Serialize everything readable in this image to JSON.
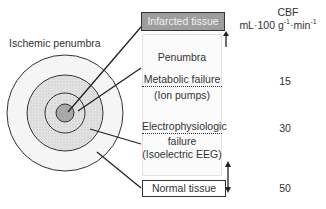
{
  "title": "Ischemic penumbra",
  "regions": {
    "infarcted": "Infarcted tissue",
    "penumbra": "Penumbra",
    "metabolic_failure": "Metabolic failure",
    "metabolic_detail": "(Ion pumps)",
    "electro_failure_line1": "Electrophysiologic",
    "electro_failure_line2": "failure",
    "electro_detail": "(Isoelectric EEG)",
    "normal": "Normal tissue"
  },
  "cbf": {
    "header": "CBF",
    "unit_prefix": "mL·100 g",
    "unit_exp1": "-1",
    "unit_mid": "·min",
    "unit_exp2": "-1",
    "thresholds": [
      "15",
      "30",
      "50"
    ]
  },
  "colors": {
    "core": "#a8a8a8",
    "stipple": "#d9d9d9",
    "outer": "#f4f4f4",
    "stroke": "#333333"
  }
}
